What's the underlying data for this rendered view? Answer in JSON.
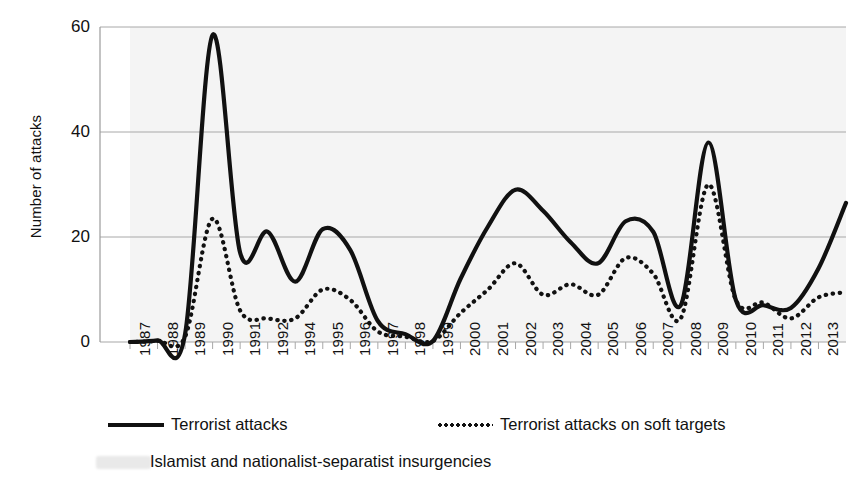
{
  "chart_data": {
    "type": "line",
    "title": "",
    "xlabel": "",
    "ylabel": "Number of attacks",
    "ylim": [
      0,
      60
    ],
    "yticks": [
      0,
      20,
      40,
      60
    ],
    "grid": "horizontal",
    "legend_position": "below-axis",
    "caption": "Islamist and nationalist-separatist insurgencies",
    "tick_labels": [
      "1987",
      "1988",
      "1989",
      "1990",
      "1991",
      "1992",
      "1994",
      "1995",
      "1996",
      "1997",
      "1998",
      "1999",
      "2000",
      "2001",
      "2002",
      "2003",
      "2004",
      "2005",
      "2006",
      "2007",
      "2008",
      "2009",
      "2010",
      "2011",
      "2012",
      "2013"
    ],
    "x": [
      1987,
      1988,
      1989,
      1990,
      1991,
      1992,
      1993,
      1994,
      1995,
      1996,
      1997,
      1998,
      1999,
      2000,
      2001,
      2002,
      2003,
      2004,
      2005,
      2006,
      2007,
      2008,
      2009,
      2010,
      2011,
      2012,
      2013
    ],
    "series": [
      {
        "name": "Terrorist attacks",
        "style": "solid",
        "color": "#111111",
        "values": [
          0,
          0.3,
          1.5,
          58.5,
          17.0,
          21.0,
          11.5,
          21.5,
          17.5,
          4.0,
          1.5,
          0.2,
          12.0,
          22.0,
          29.0,
          25.0,
          19.0,
          15.0,
          23.0,
          21.0,
          7.0,
          38.0,
          8.0,
          7.0,
          6.5,
          14.0,
          26.5
        ]
      },
      {
        "name": "Terrorist attacks on soft targets",
        "style": "dotted",
        "color": "#111111",
        "values": [
          0,
          0.2,
          1.0,
          23.5,
          6.0,
          4.5,
          4.5,
          10.0,
          8.0,
          2.0,
          1.0,
          0.2,
          5.5,
          10.0,
          15.0,
          9.0,
          11.0,
          9.0,
          16.0,
          13.0,
          4.5,
          30.0,
          8.0,
          7.5,
          4.5,
          8.5,
          9.5
        ]
      }
    ]
  },
  "legend": {
    "items": [
      {
        "label": "Terrorist attacks",
        "style": "solid"
      },
      {
        "label": "Terrorist attacks on soft targets",
        "style": "dotted"
      }
    ]
  },
  "caption": {
    "text": "Islamist and nationalist-separatist insurgencies"
  }
}
